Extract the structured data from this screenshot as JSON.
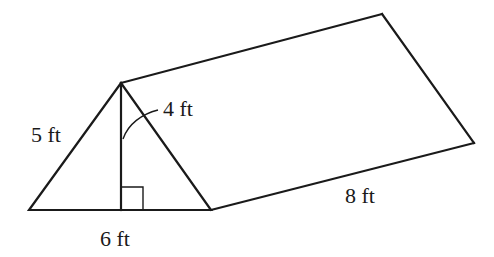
{
  "figure": {
    "type": "triangular prism",
    "labels": {
      "slant_side": "5 ft",
      "height": "4 ft",
      "base": "6 ft",
      "length": "8 ft"
    },
    "colors": {
      "stroke": "#1a1a1a",
      "background": "#ffffff"
    }
  }
}
